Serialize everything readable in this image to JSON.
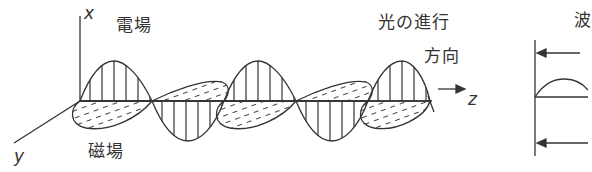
{
  "diagram": {
    "type": "electromagnetic-wave",
    "labels": {
      "axis_x": "x",
      "axis_y": "y",
      "axis_z": "z",
      "electric_field": "電場",
      "magnetic_field": "磁場",
      "propagation_line1": "光の進行",
      "propagation_line2": "方向",
      "right_panel_title": "波"
    },
    "wave": {
      "periods_shown": 2.5,
      "electric_field_style": "vertical-hatched",
      "magnetic_field_style": "dashed-diagonal-hatched"
    },
    "colors": {
      "line": "#222222",
      "background": "#ffffff"
    }
  }
}
